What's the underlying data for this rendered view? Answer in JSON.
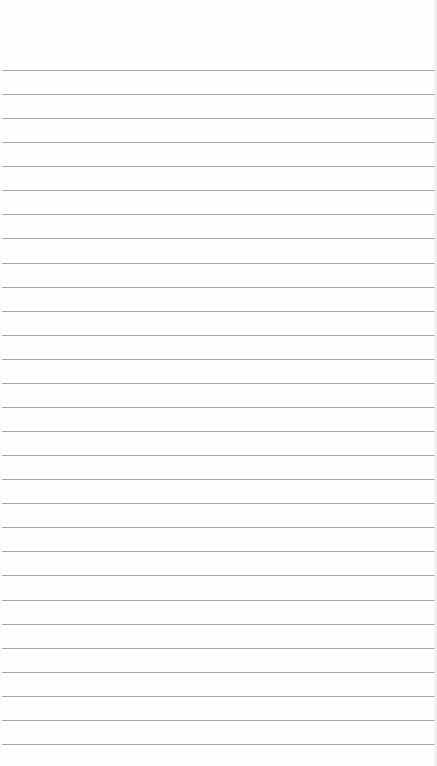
{
  "paper": {
    "type": "lined-paper",
    "background": "#fefefe",
    "line_color": "#9a9a9a",
    "first_line_y": 70,
    "line_spacing": 24.07,
    "line_count": 29,
    "text_content": ""
  }
}
